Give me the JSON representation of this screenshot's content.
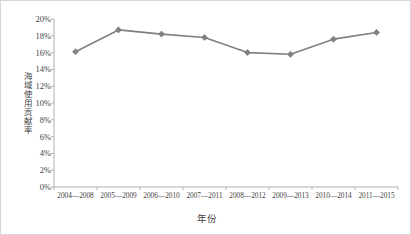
{
  "chart_data": {
    "type": "line",
    "title": "",
    "xlabel": "年份",
    "ylabel": "海域使用贡献率",
    "categories": [
      "2004—2008",
      "2005—2009",
      "2006—2010",
      "2007—2011",
      "2008—2012",
      "2009—2013",
      "2010—2014",
      "2011—2015"
    ],
    "values": [
      16.1,
      18.7,
      18.2,
      17.8,
      16.0,
      15.8,
      17.6,
      18.4
    ],
    "series": [
      {
        "name": "海域使用贡献率",
        "values": [
          16.1,
          18.7,
          18.2,
          17.8,
          16.0,
          15.8,
          17.6,
          18.4
        ]
      }
    ],
    "ylim": [
      0,
      20
    ],
    "ytick_values": [
      0,
      2,
      4,
      6,
      8,
      10,
      12,
      14,
      16,
      18,
      20
    ],
    "ytick_labels": [
      "0%",
      "2%",
      "4%",
      "6%",
      "8%",
      "10%",
      "12%",
      "14%",
      "16%",
      "18%",
      "20%"
    ],
    "grid": false,
    "legend": "none",
    "marker": "diamond",
    "line_color": "#808080",
    "marker_color": "#808080",
    "axis_color": "#b0b0b0",
    "text_color": "#3f3f3f",
    "background_color": "#ffffff"
  }
}
